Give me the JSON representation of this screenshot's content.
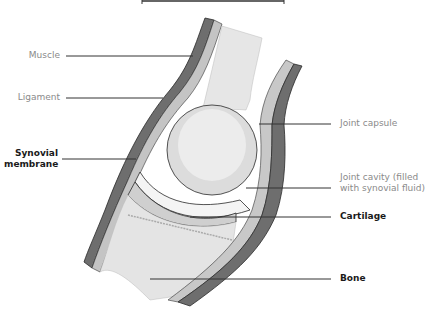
{
  "diagram": {
    "labels_left": [
      {
        "id": "muscle",
        "text": "Muscle",
        "style": "grey"
      },
      {
        "id": "ligament",
        "text": "Ligament",
        "style": "grey"
      },
      {
        "id": "synovial",
        "text_line1": "Synovial",
        "text_line2": "membrane",
        "style": "bold"
      }
    ],
    "labels_right": [
      {
        "id": "capsule",
        "text": "Joint capsule",
        "style": "grey"
      },
      {
        "id": "cavity",
        "text_line1": "Joint cavity (filled",
        "text_line2": "with synovial fluid)",
        "style": "grey"
      },
      {
        "id": "cartilage",
        "text": "Cartilage",
        "style": "bold"
      },
      {
        "id": "bone",
        "text": "Bone",
        "style": "bold"
      }
    ],
    "colors": {
      "muscle": "#6e6e6e",
      "ligament": "#bdbdbd",
      "bone": "#e4e4e4",
      "outline": "#2a2a2a",
      "leader": "#333333",
      "grey_text": "#8a8a8a"
    }
  }
}
